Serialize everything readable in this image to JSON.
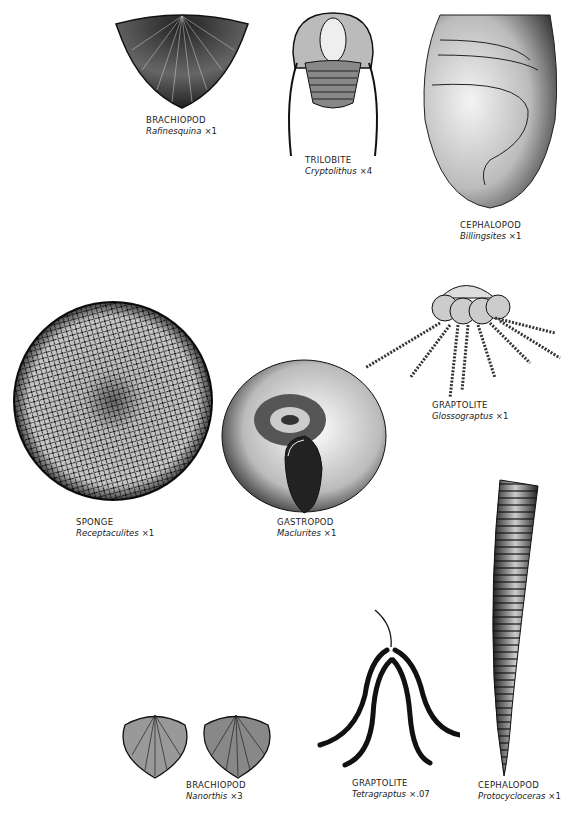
{
  "plate": {
    "specimens": [
      {
        "group": "BRACHIOPOD",
        "genus": "Rafinesquina",
        "mag": "×1"
      },
      {
        "group": "TRILOBITE",
        "genus": "Cryptolithus",
        "mag": "×4"
      },
      {
        "group": "CEPHALOPOD",
        "genus": "Billingsites",
        "mag": "×1"
      },
      {
        "group": "GRAPTOLITE",
        "genus": "Glossograptus",
        "mag": "×1"
      },
      {
        "group": "SPONGE",
        "genus": "Receptaculites",
        "mag": "×1"
      },
      {
        "group": "GASTROPOD",
        "genus": "Maclurites",
        "mag": "×1"
      },
      {
        "group": "BRACHIOPOD",
        "genus": "Nanorthis",
        "mag": "×3"
      },
      {
        "group": "GRAPTOLITE",
        "genus": "Tetragraptus",
        "mag": "×.07"
      },
      {
        "group": "CEPHALOPOD",
        "genus": "Protocycloceras",
        "mag": "×1"
      }
    ]
  },
  "colors": {
    "ink": "#111111",
    "paper": "#ffffff",
    "stipple": "#555555"
  }
}
